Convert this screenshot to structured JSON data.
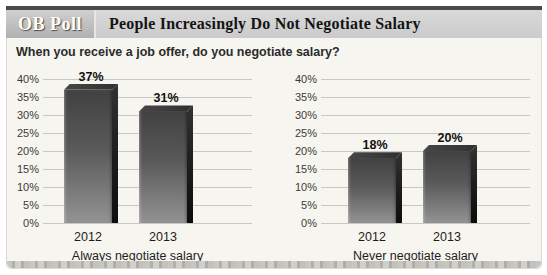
{
  "header": {
    "badge": "OB Poll",
    "title": "People Increasingly Do Not Negotiate Salary"
  },
  "question": "When you receive a job offer, do you negotiate salary?",
  "colors": {
    "top_rule": "#4a4a4a",
    "header_bg": "#d2d2d2",
    "panel_bg": "#f6f5ef",
    "gridline": "#c8c7c2",
    "bar_front_top": "#414141",
    "bar_front_bottom": "#939393",
    "bar_side": "#0c0c0c"
  },
  "chart_data": [
    {
      "type": "bar",
      "subtitle": "Always negotiate salary",
      "categories": [
        "2012",
        "2013"
      ],
      "values": [
        37,
        31
      ],
      "value_labels": [
        "37%",
        "31%"
      ],
      "ylim": [
        0,
        40
      ],
      "ytick_step": 5,
      "ytick_labels": [
        "40%",
        "35%",
        "30%",
        "25%",
        "20%",
        "15%",
        "10%",
        "5%",
        "0%"
      ],
      "grid": true,
      "legend": "none"
    },
    {
      "type": "bar",
      "subtitle": "Never negotiate salary",
      "categories": [
        "2012",
        "2013"
      ],
      "values": [
        18,
        20
      ],
      "value_labels": [
        "18%",
        "20%"
      ],
      "ylim": [
        0,
        40
      ],
      "ytick_step": 5,
      "ytick_labels": [
        "40%",
        "35%",
        "30%",
        "25%",
        "20%",
        "15%",
        "10%",
        "5%",
        "0%"
      ],
      "grid": true,
      "legend": "none"
    }
  ]
}
